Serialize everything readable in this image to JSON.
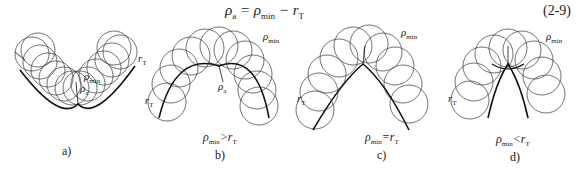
{
  "equation": {
    "lhs": "ρ",
    "lhs_sub": "a",
    "eq_sign": " = ",
    "term1": "ρ",
    "term1_sub": "min",
    "minus": " − ",
    "term2": "r",
    "term2_sub": "T",
    "number": "(2-9)"
  },
  "panels": [
    {
      "id": "a",
      "caption": "a)",
      "condition": null,
      "labels": {
        "rho_min": "ρ",
        "rho_min_sub": "min",
        "rho_a": "ρ",
        "rho_a_sub": "a",
        "rT": "r",
        "rT_sub": "T"
      }
    },
    {
      "id": "b",
      "caption": "b)",
      "condition": {
        "lhs": "ρ",
        "lhs_sub": "min",
        "op": ">",
        "rhs": "r",
        "rhs_sub": "T"
      },
      "labels": {
        "rho_min": "ρ",
        "rho_min_sub": "min",
        "rho_a": "ρ",
        "rho_a_sub": "a",
        "rT": "r",
        "rT_sub": "T"
      }
    },
    {
      "id": "c",
      "caption": "c)",
      "condition": {
        "lhs": "ρ",
        "lhs_sub": "min",
        "op": "=",
        "rhs": "r",
        "rhs_sub": "T"
      },
      "labels": {
        "rho_min": "ρ",
        "rho_min_sub": "min",
        "rT": "r",
        "rT_sub": "T"
      }
    },
    {
      "id": "d",
      "caption": "d)",
      "condition": {
        "lhs": "ρ",
        "lhs_sub": "min",
        "op": "<",
        "rhs": "r",
        "rhs_sub": "T"
      },
      "labels": {
        "rho_min": "ρ",
        "rho_min_sub": "min",
        "rT": "r",
        "rT_sub": "T"
      }
    }
  ]
}
